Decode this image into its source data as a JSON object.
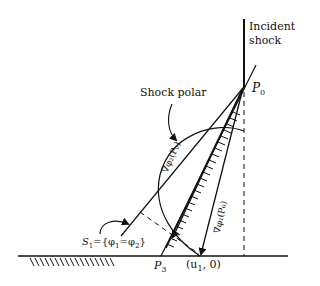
{
  "diagram": {
    "labels": {
      "incident_shock_line1": "Incident",
      "incident_shock_line2": "shock",
      "p0": "P",
      "p0_sub": "0",
      "shock_polar": "Shock polar",
      "s1": "S",
      "s1_sub": "1",
      "s1_def": "={φ",
      "s1_def_sub1": "1",
      "s1_eq": "=φ",
      "s1_def_sub2": "2",
      "s1_close": "}",
      "p3": "P",
      "p3_sub": "3",
      "u1": "(u",
      "u1_sub": "1",
      "u1_rest": ", 0)",
      "grad_phi2": "∇φ₂(P₀)",
      "grad_phi1": "∇φ₁(P₀)"
    },
    "colors": {
      "stroke": "#111111",
      "background": "#ffffff"
    }
  }
}
